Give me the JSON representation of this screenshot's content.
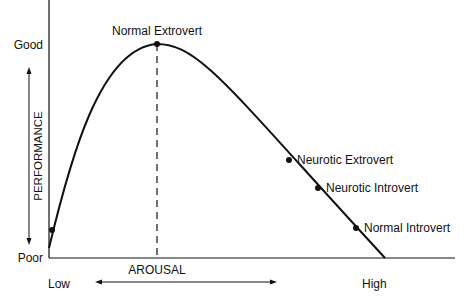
{
  "chart_data": {
    "type": "line",
    "title": "",
    "xlabel": "AROUSAL",
    "ylabel": "PERFORMANCE",
    "x_low_label": "Low",
    "x_high_label": "High",
    "y_high_label": "Good",
    "y_low_label": "Poor",
    "xlim": [
      0,
      1
    ],
    "ylim": [
      0,
      1
    ],
    "curve": {
      "description": "Inverted-U: performance rises to a peak then declines linearly",
      "points": [
        [
          0.0,
          0.05
        ],
        [
          0.05,
          0.35
        ],
        [
          0.1,
          0.6
        ],
        [
          0.15,
          0.78
        ],
        [
          0.2,
          0.9
        ],
        [
          0.25,
          0.97
        ],
        [
          0.3,
          1.0
        ],
        [
          0.4,
          0.87
        ],
        [
          0.5,
          0.68
        ],
        [
          0.6,
          0.48
        ],
        [
          0.7,
          0.28
        ],
        [
          0.8,
          0.08
        ],
        [
          0.84,
          0.0
        ]
      ]
    },
    "optimum_x": 0.3,
    "labeled_points": [
      {
        "name": "Normal Extrovert",
        "x": 0.3,
        "y": 1.0
      },
      {
        "name": "Neurotic Extrovert",
        "x": 0.61,
        "y": 0.46
      },
      {
        "name": "Neurotic Introvert",
        "x": 0.67,
        "y": 0.33
      },
      {
        "name": "Normal Introvert",
        "x": 0.75,
        "y": 0.15
      },
      {
        "name": "",
        "x": 0.005,
        "y": 0.13
      }
    ]
  }
}
